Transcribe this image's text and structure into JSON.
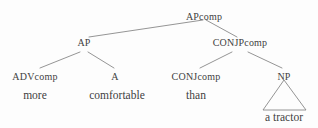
{
  "figure": {
    "type": "syntax-tree",
    "background_color": "#fdfdfd",
    "line_color": "#7a7a7a",
    "text_color": "#3f3f3f"
  },
  "nodes": {
    "root": {
      "label": "APcomp",
      "caps": "AP",
      "lower": "comp",
      "x": 204,
      "y": 12
    },
    "ap": {
      "label": "AP",
      "caps": "AP",
      "lower": "",
      "x": 84,
      "y": 38
    },
    "conjpcomp": {
      "label": "CONJPcomp",
      "caps": "CONJP",
      "lower": "comp",
      "x": 240,
      "y": 38
    },
    "advcomp": {
      "label": "ADVcomp",
      "caps": "ADV",
      "lower": "comp",
      "x": 35,
      "y": 72
    },
    "a": {
      "label": "A",
      "caps": "A",
      "lower": "",
      "x": 115,
      "y": 72
    },
    "conjcomp": {
      "label": "CONJcomp",
      "caps": "CONJ",
      "lower": "comp",
      "x": 196,
      "y": 72
    },
    "np": {
      "label": "NP",
      "caps": "NP",
      "lower": "",
      "x": 284,
      "y": 72
    }
  },
  "leaves": {
    "more": {
      "label": "more",
      "x": 35,
      "y": 90
    },
    "comfortable": {
      "label": "comfortable",
      "x": 117,
      "y": 90
    },
    "than": {
      "label": "than",
      "x": 196,
      "y": 90
    },
    "a_tractor": {
      "label": "a tractor",
      "x": 284,
      "y": 112
    }
  },
  "triangle": {
    "apex_x": 284,
    "apex_y": 80,
    "left_x": 263,
    "right_x": 306,
    "base_y": 110
  },
  "edges": [
    {
      "name": "root-to-ap",
      "x1": 203,
      "y1": 20,
      "x2": 89,
      "y2": 37
    },
    {
      "name": "root-to-conjpcomp",
      "x1": 206,
      "y1": 20,
      "x2": 237,
      "y2": 37
    },
    {
      "name": "ap-to-advcomp",
      "x1": 80,
      "y1": 52,
      "x2": 40,
      "y2": 68
    },
    {
      "name": "ap-to-a",
      "x1": 88,
      "y1": 52,
      "x2": 114,
      "y2": 68
    },
    {
      "name": "conjpcomp-to-conjcomp",
      "x1": 232,
      "y1": 52,
      "x2": 200,
      "y2": 68
    },
    {
      "name": "conjpcomp-to-np",
      "x1": 248,
      "y1": 52,
      "x2": 282,
      "y2": 68
    }
  ]
}
